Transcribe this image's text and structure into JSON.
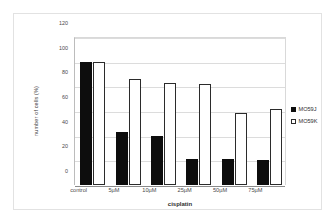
{
  "chart_data": {
    "type": "bar",
    "title": "",
    "xlabel": "cisplatin",
    "ylabel": "number of cells (%)",
    "categories": [
      "control",
      "5µM",
      "10µM",
      "25µM",
      "50µM",
      "75µM"
    ],
    "series": [
      {
        "name": "MO59J",
        "values": [
          100,
          43,
          40,
          21,
          21,
          20
        ],
        "color": "#0d0d0d",
        "style": "filled"
      },
      {
        "name": "MO59K",
        "values": [
          100,
          86,
          83,
          82,
          58,
          62
        ],
        "color": "#ffffff",
        "style": "open"
      }
    ],
    "ylim": [
      0,
      120
    ],
    "yticks": [
      0,
      20,
      40,
      60,
      80,
      100,
      120
    ],
    "ytick_labels": [
      "0",
      "20",
      "40",
      "60",
      "80",
      "100",
      "120"
    ],
    "grid": "horizontal",
    "legend_position": "right"
  },
  "legend": {
    "entries": [
      {
        "label": "MO59J",
        "marker": "filled-square-marker"
      },
      {
        "label": "MO59K",
        "marker": "open-square-marker"
      }
    ]
  }
}
